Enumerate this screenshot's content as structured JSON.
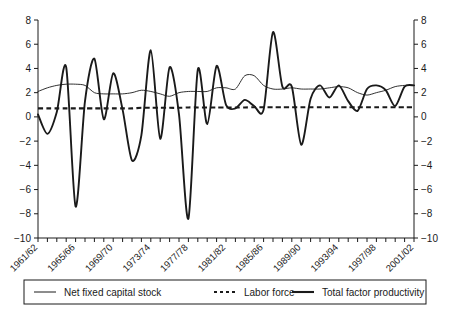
{
  "chart_data": {
    "type": "line",
    "title": "",
    "subtitle": "",
    "xlabel": "",
    "ylabel": "",
    "ylim": [
      -10,
      8
    ],
    "ytick_values": [
      8,
      6,
      4,
      2,
      0,
      -2,
      -4,
      -6,
      -8,
      -10
    ],
    "ytick_labels": [
      "8",
      "6",
      "4",
      "2",
      "0",
      "−2",
      "−4",
      "−6",
      "−8",
      "−10"
    ],
    "right_axis": true,
    "right_ytick_labels": [
      "8",
      "6",
      "4",
      "2",
      "0",
      "−2",
      "−4",
      "−6",
      "−8",
      "−10"
    ],
    "grid": false,
    "legend_position": "below-plot",
    "x": [
      "1961/62",
      "1962/63",
      "1963/64",
      "1964/65",
      "1965/66",
      "1966/67",
      "1967/68",
      "1968/69",
      "1969/70",
      "1970/71",
      "1971/72",
      "1972/73",
      "1973/74",
      "1974/75",
      "1975/76",
      "1976/77",
      "1977/78",
      "1978/79",
      "1979/80",
      "1980/81",
      "1981/82",
      "1982/83",
      "1983/84",
      "1984/85",
      "1985/86",
      "1986/87",
      "1987/88",
      "1988/89",
      "1989/90",
      "1990/91",
      "1991/92",
      "1992/93",
      "1993/94",
      "1994/95",
      "1995/96",
      "1996/97",
      "1997/98",
      "1998/99",
      "1999/00",
      "2000/01",
      "2001/02"
    ],
    "xtick_labels": [
      "1961/62",
      "1965/66",
      "1969/70",
      "1973/74",
      "1977/78",
      "1981/82",
      "1985/86",
      "1989/90",
      "1993/94",
      "1997/98",
      "2001/02"
    ],
    "xtick_every": 4,
    "series": [
      {
        "name": "Net fixed capital stock",
        "style": "thin-solid",
        "values": [
          2.1,
          2.4,
          2.6,
          2.7,
          2.7,
          2.6,
          2.0,
          1.9,
          1.9,
          1.9,
          2.0,
          2.2,
          2.1,
          1.9,
          1.7,
          2.0,
          2.1,
          2.1,
          2.1,
          2.4,
          2.4,
          2.3,
          3.4,
          3.4,
          2.6,
          2.3,
          2.3,
          2.4,
          2.3,
          2.3,
          2.3,
          2.4,
          2.5,
          2.4,
          2.0,
          1.8,
          2.0,
          2.2,
          2.5,
          2.6,
          2.6
        ]
      },
      {
        "name": "Labor force",
        "style": "dashed",
        "values": [
          0.7,
          0.7,
          0.7,
          0.7,
          0.7,
          0.7,
          0.7,
          0.7,
          0.7,
          0.7,
          0.7,
          0.75,
          0.75,
          0.75,
          0.75,
          0.75,
          0.78,
          0.78,
          0.78,
          0.78,
          0.78,
          0.78,
          0.78,
          0.8,
          0.8,
          0.8,
          0.8,
          0.8,
          0.8,
          0.8,
          0.8,
          0.8,
          0.8,
          0.8,
          0.8,
          0.8,
          0.8,
          0.8,
          0.8,
          0.8,
          0.8
        ]
      },
      {
        "name": "Total factor productivity",
        "style": "thick-solid",
        "values": [
          0.2,
          -1.4,
          0.4,
          4.1,
          -7.4,
          1.3,
          4.8,
          -0.2,
          3.6,
          0.6,
          -3.6,
          -1.5,
          5.5,
          -1.8,
          4.1,
          0.2,
          -8.4,
          3.9,
          -0.6,
          4.2,
          1.0,
          0.7,
          1.4,
          0.9,
          0.6,
          7.0,
          2.5,
          2.5,
          -2.3,
          1.5,
          2.6,
          1.6,
          2.6,
          1.3,
          0.5,
          2.3,
          2.6,
          2.2,
          0.9,
          2.5,
          2.6
        ]
      }
    ]
  },
  "legend": {
    "items": [
      {
        "label": "Net fixed capital stock",
        "style": "thin-solid"
      },
      {
        "label": "Labor force",
        "style": "dashed"
      },
      {
        "label": "Total factor productivity",
        "style": "thick-solid"
      }
    ]
  },
  "colors": {
    "ink": "#1a1a1a",
    "background": "#ffffff"
  }
}
